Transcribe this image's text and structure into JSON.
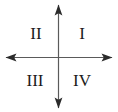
{
  "figure": {
    "background_color": "#ffffff",
    "width": 118,
    "height": 112
  },
  "axes": {
    "stroke_color": "#5a5a5a",
    "stroke_width": 1.2,
    "arrowhead_color": "#2b2b2b",
    "origin": {
      "x": 58.5,
      "y": 57.5
    },
    "horizontal": {
      "x_start": 6,
      "x_end": 112,
      "y": 57.5
    },
    "vertical": {
      "y_start": 5,
      "y_end": 108,
      "x": 58.5
    },
    "arrowheads": [
      "up",
      "down",
      "left",
      "right"
    ]
  },
  "labels": {
    "quadrant_1": {
      "text": "I",
      "x": 82,
      "y": 33
    },
    "quadrant_2": {
      "text": "II",
      "x": 36,
      "y": 33
    },
    "quadrant_3": {
      "text": "III",
      "x": 35,
      "y": 80
    },
    "quadrant_4": {
      "text": "IV",
      "x": 82,
      "y": 80
    }
  }
}
